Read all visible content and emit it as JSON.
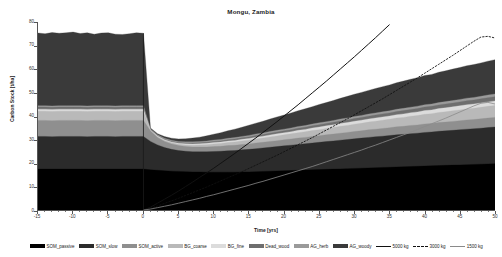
{
  "chart_data": {
    "type": "area",
    "title": "Mongu, Zambia",
    "xlabel": "Time [yrs]",
    "ylabel": "Carbon Stock [t/ha]",
    "xlim": [
      -15,
      50
    ],
    "ylim": [
      0,
      80
    ],
    "grid": false,
    "legend_position": "bottom",
    "xticks": [
      -15,
      -10,
      -5,
      0,
      5,
      10,
      15,
      20,
      25,
      30,
      35,
      40,
      45,
      50
    ],
    "yticks": [
      0,
      10,
      20,
      30,
      40,
      50,
      60,
      70,
      80
    ],
    "x": [
      -15,
      -14,
      -13,
      -12,
      -11,
      -10,
      -9,
      -8,
      -7,
      -6,
      -5,
      -4,
      -3,
      -2,
      -1,
      0,
      1,
      2,
      3,
      4,
      5,
      6,
      7,
      8,
      9,
      10,
      11,
      12,
      13,
      14,
      15,
      16,
      17,
      18,
      19,
      20,
      21,
      22,
      23,
      24,
      25,
      26,
      27,
      28,
      29,
      30,
      31,
      32,
      33,
      34,
      35,
      36,
      37,
      38,
      39,
      40,
      41,
      42,
      43,
      44,
      45,
      46,
      47,
      48,
      49,
      50
    ],
    "stacked_series": [
      {
        "name": "SOM_passive",
        "color": "#000000",
        "values": [
          17.4,
          17.4,
          17.4,
          17.4,
          17.4,
          17.4,
          17.4,
          17.4,
          17.4,
          17.4,
          17.4,
          17.4,
          17.4,
          17.4,
          17.4,
          17.4,
          17.1,
          16.9,
          16.7,
          16.5,
          16.4,
          16.3,
          16.2,
          16.2,
          16.1,
          16.1,
          16.1,
          16.1,
          16.1,
          16.2,
          16.2,
          16.3,
          16.4,
          16.5,
          16.6,
          16.7,
          16.8,
          16.9,
          17.0,
          17.1,
          17.2,
          17.3,
          17.4,
          17.5,
          17.6,
          17.7,
          17.8,
          17.9,
          18.0,
          18.1,
          18.2,
          18.3,
          18.4,
          18.5,
          18.6,
          18.7,
          18.8,
          18.9,
          19.0,
          19.1,
          19.2,
          19.3,
          19.4,
          19.5,
          19.6,
          19.7
        ]
      },
      {
        "name": "SOM_slow",
        "color": "#2b2b2b",
        "values": [
          13.9,
          13.9,
          13.8,
          13.9,
          13.9,
          13.9,
          13.9,
          13.8,
          13.9,
          13.9,
          13.9,
          13.8,
          13.9,
          13.9,
          13.9,
          13.9,
          12.1,
          10.8,
          9.9,
          9.3,
          8.9,
          8.7,
          8.6,
          8.6,
          8.7,
          8.8,
          8.9,
          9.1,
          9.2,
          9.4,
          9.6,
          9.8,
          10.0,
          10.2,
          10.4,
          10.6,
          10.8,
          11.0,
          11.2,
          11.4,
          11.6,
          11.8,
          12.0,
          12.2,
          12.4,
          12.6,
          12.8,
          13.0,
          13.2,
          13.3,
          13.5,
          13.7,
          13.8,
          14.0,
          14.1,
          14.3,
          14.4,
          14.6,
          14.7,
          14.8,
          15.0,
          15.1,
          15.2,
          15.3,
          15.5,
          15.6
        ]
      },
      {
        "name": "SOM_active",
        "color": "#8f8f8f",
        "values": [
          6.8,
          6.8,
          6.8,
          6.8,
          6.8,
          6.8,
          6.8,
          6.8,
          6.8,
          6.8,
          6.8,
          6.8,
          6.8,
          6.8,
          6.8,
          6.8,
          4.4,
          3.2,
          2.6,
          2.3,
          2.1,
          2.0,
          2.0,
          2.0,
          2.0,
          2.1,
          2.1,
          2.2,
          2.2,
          2.3,
          2.3,
          2.4,
          2.4,
          2.5,
          2.5,
          2.6,
          2.6,
          2.7,
          2.7,
          2.8,
          2.8,
          2.9,
          2.9,
          3.0,
          3.0,
          3.1,
          3.1,
          3.2,
          3.2,
          3.3,
          3.3,
          3.4,
          3.4,
          3.5,
          3.5,
          3.6,
          3.6,
          3.7,
          3.7,
          3.8,
          3.8,
          3.9,
          3.9,
          4.0,
          4.0,
          4.1
        ]
      },
      {
        "name": "BG_coarse",
        "color": "#b9b9b9",
        "values": [
          3.9,
          3.9,
          3.9,
          3.9,
          3.9,
          3.9,
          3.9,
          3.9,
          3.9,
          3.9,
          3.9,
          3.9,
          3.9,
          3.9,
          3.9,
          3.9,
          0.2,
          0.3,
          0.4,
          0.5,
          0.6,
          0.7,
          0.8,
          0.9,
          1.0,
          1.1,
          1.2,
          1.3,
          1.4,
          1.5,
          1.6,
          1.7,
          1.8,
          1.9,
          2.0,
          2.1,
          2.2,
          2.3,
          2.4,
          2.5,
          2.6,
          2.7,
          2.8,
          2.9,
          3.0,
          3.1,
          3.2,
          3.3,
          3.4,
          3.5,
          3.6,
          3.7,
          3.8,
          3.9,
          4.0,
          4.1,
          4.2,
          4.3,
          4.4,
          4.5,
          4.6,
          4.7,
          4.8,
          4.9,
          5.0,
          5.1
        ]
      },
      {
        "name": "BG_fine",
        "color": "#dcdcdc",
        "values": [
          0.9,
          0.9,
          0.9,
          0.9,
          0.9,
          0.9,
          0.9,
          0.9,
          0.9,
          0.9,
          0.9,
          0.9,
          0.9,
          0.9,
          0.9,
          0.9,
          0.2,
          0.25,
          0.3,
          0.35,
          0.4,
          0.45,
          0.5,
          0.5,
          0.55,
          0.6,
          0.6,
          0.65,
          0.7,
          0.7,
          0.75,
          0.8,
          0.8,
          0.85,
          0.9,
          0.9,
          0.95,
          1.0,
          1.0,
          1.05,
          1.1,
          1.1,
          1.15,
          1.2,
          1.2,
          1.25,
          1.3,
          1.3,
          1.35,
          1.4,
          1.4,
          1.45,
          1.5,
          1.5,
          1.55,
          1.6,
          1.6,
          1.65,
          1.7,
          1.7,
          1.75,
          1.8,
          1.8,
          1.85,
          1.9,
          1.9
        ]
      },
      {
        "name": "Dead_wood",
        "color": "#6e6e6e",
        "values": [
          0.9,
          0.9,
          0.9,
          0.9,
          0.9,
          0.9,
          0.9,
          0.9,
          0.9,
          0.9,
          0.9,
          0.9,
          0.9,
          0.9,
          0.9,
          0.9,
          0.2,
          0.2,
          0.25,
          0.3,
          0.3,
          0.35,
          0.4,
          0.4,
          0.45,
          0.5,
          0.5,
          0.55,
          0.6,
          0.6,
          0.65,
          0.7,
          0.7,
          0.75,
          0.8,
          0.8,
          0.85,
          0.9,
          0.9,
          0.95,
          1.0,
          1.0,
          1.05,
          1.1,
          1.1,
          1.15,
          1.2,
          1.2,
          1.25,
          1.3,
          1.3,
          1.35,
          1.4,
          1.4,
          1.45,
          1.5,
          1.5,
          1.55,
          1.6,
          1.6,
          1.65,
          1.7,
          1.7,
          1.75,
          1.8,
          1.8
        ]
      },
      {
        "name": "AG_herb",
        "color": "#9a9a9a",
        "values": [
          0.6,
          0.6,
          0.6,
          0.6,
          0.6,
          0.6,
          0.6,
          0.6,
          0.6,
          0.6,
          0.6,
          0.6,
          0.6,
          0.6,
          0.6,
          0.6,
          0.3,
          0.35,
          0.4,
          0.4,
          0.45,
          0.5,
          0.5,
          0.5,
          0.55,
          0.55,
          0.6,
          0.6,
          0.6,
          0.6,
          0.65,
          0.65,
          0.65,
          0.7,
          0.7,
          0.7,
          0.7,
          0.75,
          0.75,
          0.75,
          0.8,
          0.8,
          0.8,
          0.8,
          0.85,
          0.85,
          0.85,
          0.9,
          0.9,
          0.9,
          0.9,
          0.95,
          0.95,
          0.95,
          1.0,
          1.0,
          1.0,
          1.0,
          1.05,
          1.05,
          1.05,
          1.1,
          1.1,
          1.1,
          1.15,
          1.15
        ]
      },
      {
        "name": "AG_woody",
        "color": "#3a3a3a",
        "values": [
          30.9,
          30.6,
          31.2,
          30.8,
          31.0,
          31.3,
          30.7,
          31.1,
          30.4,
          30.9,
          31.0,
          30.5,
          30.3,
          30.6,
          31.0,
          30.8,
          0.4,
          0.5,
          0.7,
          0.9,
          1.1,
          1.3,
          1.6,
          1.9,
          2.2,
          2.5,
          2.9,
          3.2,
          3.6,
          3.9,
          4.3,
          4.6,
          5.0,
          5.3,
          5.7,
          6.0,
          6.4,
          6.7,
          7.1,
          7.4,
          7.8,
          8.1,
          8.5,
          8.8,
          9.2,
          9.5,
          9.8,
          10.1,
          10.4,
          10.7,
          11.0,
          11.3,
          11.6,
          11.9,
          12.1,
          12.4,
          12.6,
          12.9,
          13.1,
          13.4,
          13.6,
          13.8,
          14.0,
          14.2,
          14.4,
          14.6
        ]
      }
    ],
    "line_series": [
      {
        "name": "5000 kg",
        "color": "#111111",
        "style": "solid",
        "width": 1.0,
        "x": [
          0,
          1,
          2,
          3,
          4,
          5,
          6,
          7,
          8,
          9,
          10,
          11,
          12,
          13,
          14,
          15,
          16,
          17,
          18,
          19,
          20,
          21,
          22,
          23,
          24,
          25,
          26,
          27,
          28,
          29,
          30,
          31,
          32,
          33,
          34,
          35
        ],
        "values": [
          0,
          1.2,
          2.9,
          4.6,
          6.3,
          8.1,
          10.0,
          11.9,
          13.9,
          15.8,
          17.8,
          19.9,
          22.0,
          24.1,
          26.3,
          28.5,
          30.7,
          33.0,
          35.3,
          37.6,
          40.0,
          42.4,
          44.8,
          47.3,
          49.8,
          52.3,
          54.8,
          57.4,
          60.0,
          62.6,
          65.2,
          67.9,
          70.6,
          73.3,
          76.1,
          78.9
        ]
      },
      {
        "name": "3000 kg",
        "color": "#111111",
        "style": "dashed",
        "width": 0.9,
        "x": [
          0,
          1,
          2,
          3,
          4,
          5,
          6,
          7,
          8,
          9,
          10,
          11,
          12,
          13,
          14,
          15,
          16,
          17,
          18,
          19,
          20,
          21,
          22,
          23,
          24,
          25,
          26,
          27,
          28,
          29,
          30,
          31,
          32,
          33,
          34,
          35,
          36,
          37,
          38,
          39,
          40,
          41,
          42,
          43,
          44,
          45,
          46,
          47,
          48,
          49,
          50
        ],
        "values": [
          0,
          0.7,
          1.7,
          2.8,
          3.9,
          5.0,
          6.2,
          7.4,
          8.6,
          9.8,
          11.1,
          12.4,
          13.7,
          15.0,
          16.3,
          17.7,
          19.1,
          20.5,
          21.9,
          23.3,
          24.8,
          26.3,
          27.8,
          29.3,
          30.8,
          32.4,
          34.0,
          35.6,
          37.2,
          38.8,
          40.5,
          42.2,
          43.9,
          45.6,
          47.3,
          49.1,
          50.9,
          52.7,
          54.5,
          56.3,
          58.2,
          60.1,
          62.0,
          63.9,
          65.8,
          67.8,
          69.8,
          71.8,
          73.6,
          73.9,
          73.2
        ]
      },
      {
        "name": "1500 kg",
        "color": "#8a8a8a",
        "style": "solid",
        "width": 0.8,
        "x": [
          0,
          1,
          2,
          3,
          4,
          5,
          6,
          7,
          8,
          9,
          10,
          11,
          12,
          13,
          14,
          15,
          16,
          17,
          18,
          19,
          20,
          21,
          22,
          23,
          24,
          25,
          26,
          27,
          28,
          29,
          30,
          31,
          32,
          33,
          34,
          35,
          36,
          37,
          38,
          39,
          40,
          41,
          42,
          43,
          44,
          45,
          46,
          47,
          48,
          49,
          50
        ],
        "values": [
          0,
          0.4,
          1.0,
          1.6,
          2.2,
          2.9,
          3.6,
          4.3,
          5.0,
          5.8,
          6.5,
          7.3,
          8.1,
          8.9,
          9.7,
          10.5,
          11.4,
          12.2,
          13.1,
          14.0,
          14.9,
          15.8,
          16.7,
          17.6,
          18.5,
          19.5,
          20.5,
          21.5,
          22.5,
          23.5,
          24.5,
          25.5,
          26.6,
          27.6,
          28.7,
          29.8,
          30.9,
          32.0,
          33.1,
          34.3,
          35.5,
          36.7,
          37.9,
          39.1,
          40.4,
          41.7,
          43.0,
          44.3,
          45.4,
          45.8,
          45.1
        ]
      }
    ],
    "legend": [
      {
        "label": "SOM_passive",
        "color": "#000000",
        "marker": "swatch"
      },
      {
        "label": "SOM_slow",
        "color": "#2b2b2b",
        "marker": "swatch"
      },
      {
        "label": "SOM_active",
        "color": "#8f8f8f",
        "marker": "swatch"
      },
      {
        "label": "BG_coarse",
        "color": "#b9b9b9",
        "marker": "swatch"
      },
      {
        "label": "BG_fine",
        "color": "#dcdcdc",
        "marker": "swatch"
      },
      {
        "label": "Dead_wood",
        "color": "#6e6e6e",
        "marker": "swatch"
      },
      {
        "label": "AG_herb",
        "color": "#9a9a9a",
        "marker": "swatch"
      },
      {
        "label": "AG_woody",
        "color": "#3a3a3a",
        "marker": "swatch"
      },
      {
        "label": "5000 kg",
        "color": "#111111",
        "marker": "line-solid"
      },
      {
        "label": "3000 kg",
        "color": "#111111",
        "marker": "line-dashed"
      },
      {
        "label": "1500 kg",
        "color": "#8a8a8a",
        "marker": "line-thin"
      }
    ]
  }
}
